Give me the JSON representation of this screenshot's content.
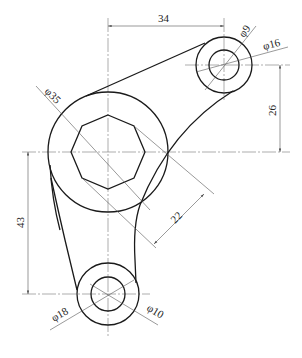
{
  "drawing": {
    "type": "mechanical part drawing (lever / rocker arm)",
    "dimensions": {
      "horizontal_offset": "34",
      "vertical_offset_upper": "26",
      "vertical_offset_lower": "43",
      "octagon_across_flats": "22",
      "large_boss_diameter": "φ35",
      "upper_boss_outer_diameter": "φ16",
      "upper_hole_diameter": "φ9",
      "lower_boss_outer_diameter": "φ18",
      "lower_hole_diameter": "φ10"
    },
    "features": [
      {
        "name": "large-boss",
        "shape": "circle",
        "label": "φ35"
      },
      {
        "name": "octagonal-hole",
        "shape": "octagon",
        "label": "22"
      },
      {
        "name": "upper-boss",
        "shape": "concentric circles",
        "labels": [
          "φ16",
          "φ9"
        ]
      },
      {
        "name": "lower-boss",
        "shape": "concentric circles",
        "labels": [
          "φ18",
          "φ10"
        ]
      }
    ],
    "colors": {
      "outline": "#1a1a1a",
      "dimension_lines": "#555555",
      "background": "#ffffff"
    }
  }
}
